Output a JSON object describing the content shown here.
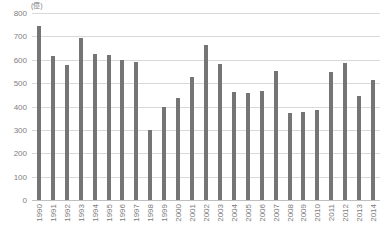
{
  "chart_data": {
    "type": "bar",
    "title": "",
    "subtitle": "",
    "xlabel": "",
    "ylabel": "",
    "unit_label": "(億)",
    "ylim": [
      0,
      800
    ],
    "yticks": [
      800,
      700,
      600,
      500,
      400,
      300,
      200,
      100,
      0
    ],
    "grid": true,
    "legend": false,
    "legend_position": "none",
    "series_color": "#757575",
    "categories": [
      "1990",
      "1991",
      "1992",
      "1993",
      "1994",
      "1995",
      "1996",
      "1997",
      "1998",
      "1999",
      "2000",
      "2001",
      "2002",
      "2003",
      "2004",
      "2005",
      "2006",
      "2007",
      "2008",
      "2009",
      "2010",
      "2011",
      "2012",
      "2013",
      "2014"
    ],
    "values": [
      745,
      615,
      578,
      693,
      625,
      620,
      597,
      592,
      300,
      398,
      435,
      528,
      663,
      583,
      462,
      458,
      468,
      551,
      372,
      378,
      383,
      548,
      588,
      443,
      513
    ]
  }
}
